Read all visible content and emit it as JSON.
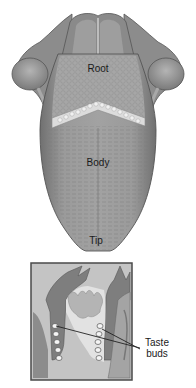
{
  "figure": {
    "labels": {
      "root": "Root",
      "body": "Body",
      "tip": "Tip"
    },
    "inset": {
      "label_line1": "Taste",
      "label_line2": "buds"
    }
  },
  "colors": {
    "background": "#ffffff",
    "tongue_fill": "#9a9a9a",
    "tongue_dark": "#6e6e6e",
    "tongue_edge": "#555555",
    "root_fill": "#a8a8a8",
    "papillae": "#d8d8d8",
    "inset_border": "#4a4a4a",
    "inset_bg": "#c8c8c8",
    "pointer_line": "#222222"
  }
}
